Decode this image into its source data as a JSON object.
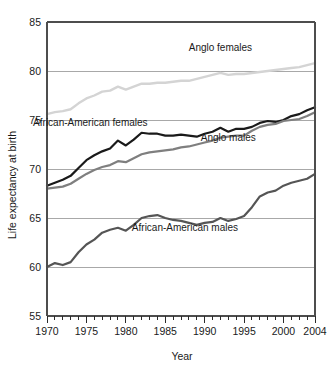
{
  "chart_data": {
    "type": "line",
    "title": "",
    "xlabel": "Year",
    "ylabel": "Life expectancy at birth",
    "xlim": [
      1970,
      2004
    ],
    "ylim": [
      55,
      85
    ],
    "ytick_values": [
      55,
      60,
      65,
      70,
      75,
      80,
      85
    ],
    "ytick_labels": [
      "55",
      "60",
      "65",
      "70",
      "75",
      "80",
      "85"
    ],
    "xtick_values": [
      1970,
      1975,
      1980,
      1985,
      1990,
      1995,
      2000,
      2004
    ],
    "xtick_labels": [
      "1970",
      "1975",
      "1980",
      "1985",
      "1990",
      "1995",
      "2000",
      "2004"
    ],
    "minor_xticks_every": 1,
    "grid": "horizontal",
    "legend_position": "inline-annotations",
    "x": [
      1970,
      1971,
      1972,
      1973,
      1974,
      1975,
      1976,
      1977,
      1978,
      1979,
      1980,
      1981,
      1982,
      1983,
      1984,
      1985,
      1986,
      1987,
      1988,
      1989,
      1990,
      1991,
      1992,
      1993,
      1994,
      1995,
      1996,
      1997,
      1998,
      1999,
      2000,
      2001,
      2002,
      2003,
      2004
    ],
    "series": [
      {
        "name": "Anglo females",
        "color": "#d4d4d4",
        "label_x": 1992.0,
        "label_y": 82.0,
        "values": [
          75.6,
          75.8,
          75.9,
          76.1,
          76.7,
          77.2,
          77.5,
          77.9,
          78.0,
          78.4,
          78.1,
          78.4,
          78.7,
          78.7,
          78.8,
          78.8,
          78.9,
          79.0,
          79.0,
          79.2,
          79.4,
          79.6,
          79.8,
          79.6,
          79.7,
          79.7,
          79.8,
          79.9,
          80.0,
          80.1,
          80.2,
          80.3,
          80.4,
          80.6,
          80.8
        ]
      },
      {
        "name": "African-American females",
        "color": "#1a1a1a",
        "label_x": 1975.5,
        "label_y": 74.4,
        "values": [
          68.3,
          68.6,
          68.9,
          69.3,
          70.1,
          70.9,
          71.4,
          71.8,
          72.1,
          72.9,
          72.4,
          73.0,
          73.7,
          73.6,
          73.6,
          73.4,
          73.4,
          73.5,
          73.4,
          73.3,
          73.6,
          73.8,
          74.2,
          73.8,
          74.1,
          74.1,
          74.3,
          74.7,
          74.9,
          74.8,
          75.0,
          75.4,
          75.6,
          76.0,
          76.3
        ]
      },
      {
        "name": "Anglo males",
        "color": "#7f7f7f",
        "label_x": 1993.0,
        "label_y": 72.9,
        "values": [
          68.0,
          68.1,
          68.2,
          68.5,
          69.0,
          69.5,
          69.9,
          70.2,
          70.4,
          70.8,
          70.7,
          71.1,
          71.5,
          71.7,
          71.8,
          71.9,
          72.0,
          72.2,
          72.3,
          72.5,
          72.7,
          72.9,
          73.2,
          73.3,
          73.4,
          73.4,
          73.9,
          74.3,
          74.5,
          74.6,
          74.9,
          75.0,
          75.1,
          75.4,
          75.8
        ]
      },
      {
        "name": "African-American males",
        "color": "#555555",
        "label_x": 1987.5,
        "label_y": 63.7,
        "values": [
          60.0,
          60.4,
          60.2,
          60.5,
          61.5,
          62.3,
          62.8,
          63.5,
          63.8,
          64.0,
          63.7,
          64.3,
          65.0,
          65.2,
          65.3,
          65.0,
          64.8,
          64.7,
          64.5,
          64.3,
          64.5,
          64.6,
          65.0,
          64.7,
          64.9,
          65.2,
          66.1,
          67.2,
          67.6,
          67.8,
          68.3,
          68.6,
          68.8,
          69.0,
          69.5
        ]
      }
    ]
  },
  "axes": {
    "y_title": "Life expectancy at birth",
    "x_title": "Year"
  }
}
